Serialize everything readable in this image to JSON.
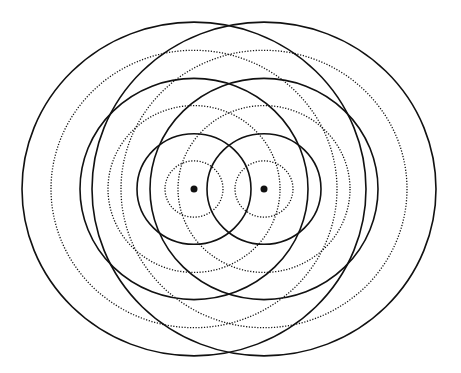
{
  "diagram": {
    "title": "",
    "background": "#ffffff",
    "stroke_color": "#111111",
    "scale_y": 0.97,
    "sources": [
      {
        "id": "source-left",
        "cx": 194,
        "cy": 189
      },
      {
        "id": "source-right",
        "cx": 264,
        "cy": 189
      }
    ],
    "source_dot_radius": 3.5,
    "rings": [
      {
        "r": 29,
        "style": "dotted"
      },
      {
        "r": 57,
        "style": "solid"
      },
      {
        "r": 86,
        "style": "dotted"
      },
      {
        "r": 114,
        "style": "solid"
      },
      {
        "r": 143,
        "style": "dotted"
      },
      {
        "r": 172,
        "style": "solid"
      }
    ]
  }
}
